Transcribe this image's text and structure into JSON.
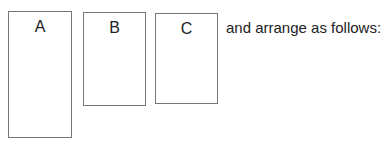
{
  "boxes": [
    {
      "label": "A"
    },
    {
      "label": "B"
    },
    {
      "label": "C"
    }
  ],
  "instruction": "and arrange as follows:"
}
